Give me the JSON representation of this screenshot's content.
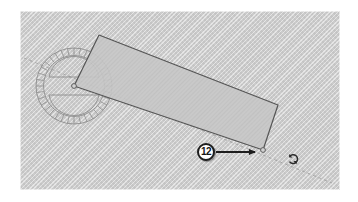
{
  "app": {
    "scene_title": "Rotate tool protractor on extruded rectangle",
    "canvas": {
      "width": 358,
      "height": 202,
      "background_color": "#ffffff",
      "viewport_color": "#cfcfcf",
      "viewport_x": 20,
      "viewport_y": 11,
      "viewport_width": 320,
      "viewport_height": 179
    }
  },
  "geometry": {
    "protractor": {
      "center_x": 54,
      "center_y": 75,
      "outer_radius": 38,
      "tick_inner_radius": 31,
      "inner_radius": 30,
      "arc_radius": 25,
      "tick_count": 36,
      "stroke_color": "#8a8a8a",
      "stroke_width": 0.9
    },
    "rotated_rect": {
      "points": "79,24 54,75 243,139 258,94",
      "stroke_color": "#555555",
      "stroke_width": 1.2,
      "fill_color": "#c6c6c6",
      "hatch_color": "#b0b0b0"
    },
    "inference_line": {
      "x1": 4,
      "y1": 47,
      "x2": 312,
      "y2": 172,
      "stroke_color": "#9a9a9a",
      "dash": "3 3",
      "stroke_width": 0.8
    },
    "origin_point": {
      "x": 54,
      "y": 75,
      "radius": 2.4,
      "color": "#6f6f6f"
    },
    "pivot_point": {
      "x": 243,
      "y": 139,
      "radius": 2.4,
      "color": "#6f6f6f"
    }
  },
  "annotations": {
    "callout": {
      "label": "12",
      "center_x": 206,
      "center_y": 152,
      "radius": 9,
      "fill_color": "#ffffff",
      "border_color": "#1d1d1d",
      "text_color": "#161616"
    },
    "leader_arrow": {
      "x1": 196,
      "y1": 141,
      "x2": 238,
      "y2": 141,
      "stroke_color": "#1d1d1d",
      "stroke_width": 2
    }
  },
  "cursor": {
    "kind": "rotate-cursor",
    "x": 288,
    "y": 153,
    "color": "#2b2b2b"
  }
}
